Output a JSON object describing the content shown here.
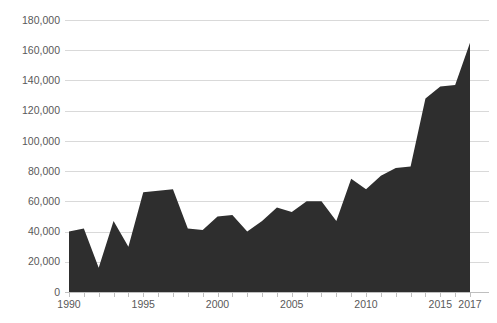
{
  "chart_data": {
    "type": "area",
    "title": "",
    "subtitle": "",
    "xlabel": "",
    "ylabel": "",
    "xlim": [
      1990,
      2017
    ],
    "ylim": [
      0,
      180000
    ],
    "grid": true,
    "legend": false,
    "legend_position": "none",
    "series_color": "#2e2e2e",
    "gridline_color": "#d9d9d9",
    "axis_color": "#bfbfbf",
    "tick_label_color": "#595959",
    "background_color": "#ffffff",
    "y_ticks": [
      0,
      20000,
      40000,
      60000,
      80000,
      100000,
      120000,
      140000,
      160000,
      180000
    ],
    "y_tick_labels": [
      "0",
      "20,000",
      "40,000",
      "60,000",
      "80,000",
      "100,000",
      "120,000",
      "140,000",
      "160,000",
      "180,000"
    ],
    "x_ticks": [
      1990,
      1995,
      2000,
      2005,
      2010,
      2015,
      2017
    ],
    "x_tick_labels": [
      "1990",
      "1995",
      "2000",
      "2005",
      "2010",
      "2015",
      "2017"
    ],
    "x": [
      1990,
      1991,
      1992,
      1993,
      1994,
      1995,
      1996,
      1997,
      1998,
      1999,
      2000,
      2001,
      2002,
      2003,
      2004,
      2005,
      2006,
      2007,
      2008,
      2009,
      2010,
      2011,
      2012,
      2013,
      2014,
      2015,
      2016,
      2017
    ],
    "series": [
      {
        "name": "",
        "values": [
          40000,
          42000,
          16000,
          47000,
          30000,
          66000,
          67000,
          68000,
          42000,
          41000,
          50000,
          51000,
          40000,
          47000,
          56000,
          53000,
          60000,
          60000,
          47000,
          75000,
          68000,
          77000,
          82000,
          83000,
          128000,
          136000,
          137000,
          165000
        ]
      }
    ]
  }
}
